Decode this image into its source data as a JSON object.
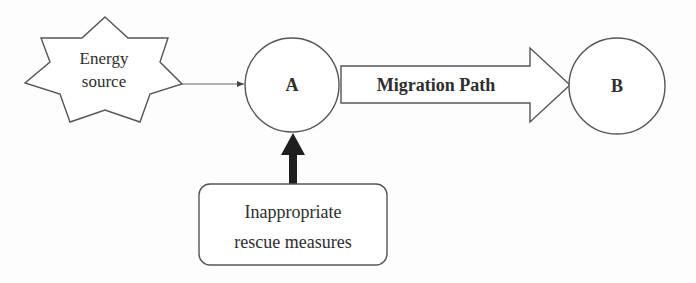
{
  "diagram": {
    "nodes": {
      "energy_source": {
        "line1": "Energy",
        "line2": "source",
        "shape": "star"
      },
      "node_a": {
        "label": "A",
        "shape": "circle"
      },
      "node_b": {
        "label": "B",
        "shape": "circle"
      },
      "rescue": {
        "line1": "Inappropriate",
        "line2": "rescue measures",
        "shape": "rounded-rectangle"
      }
    },
    "edges": {
      "migration_path": {
        "label": "Migration Path",
        "from": "A",
        "to": "B",
        "style": "block-arrow"
      },
      "energy_to_a": {
        "from": "Energy source",
        "to": "A",
        "style": "thin-arrow"
      },
      "rescue_to_a": {
        "from": "Inappropriate rescue measures",
        "to": "A",
        "style": "thick-black-arrow"
      }
    },
    "colors": {
      "stroke": "#555555",
      "text": "#2e2e2e",
      "thick_arrow": "#1e1e1e",
      "background": "#fdfdfd"
    }
  }
}
